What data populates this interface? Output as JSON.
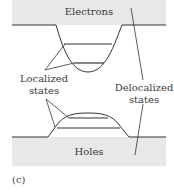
{
  "figure": {
    "panel_label": "(c)",
    "bands": {
      "conduction": "Electrons",
      "valence": "Holes"
    },
    "labels": {
      "localized_line1": "Localized",
      "localized_line2": "states",
      "delocalized_line1": "Delocalized",
      "delocalized_line2": "states"
    },
    "colors": {
      "band_fill": "#e8e8e8",
      "line": "#333333"
    }
  }
}
